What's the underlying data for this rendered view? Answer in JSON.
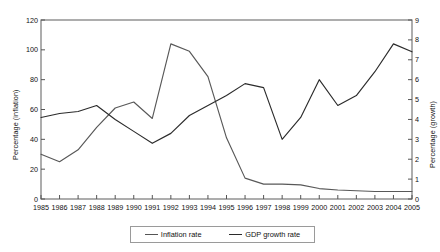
{
  "chart_data": {
    "type": "line",
    "title": "",
    "subtitle": "",
    "xlabel": "",
    "ylabel": "Percentage (inflation)",
    "ylabel_secondary": "Percentage (growth)",
    "x": [
      1985,
      1986,
      1987,
      1988,
      1989,
      1990,
      1991,
      1992,
      1993,
      1994,
      1995,
      1996,
      1997,
      1998,
      1999,
      2000,
      2001,
      2002,
      2003,
      2004,
      2005
    ],
    "xtick_labels": [
      "1985",
      "1986",
      "1987",
      "1988",
      "1989",
      "1990",
      "1991",
      "1992",
      "1993",
      "1994",
      "1995",
      "1996",
      "1997",
      "1998",
      "1999",
      "2000",
      "2001",
      "2002",
      "2003",
      "2004",
      "2005"
    ],
    "ylim": [
      0,
      120
    ],
    "ytick_labels": [
      "0",
      "20",
      "40",
      "60",
      "80",
      "100",
      "120"
    ],
    "ytick_values": [
      0,
      20,
      40,
      60,
      80,
      100,
      120
    ],
    "ylim_secondary": [
      0,
      9
    ],
    "ytick_labels_secondary": [
      "0",
      "1",
      "2",
      "3",
      "4",
      "5",
      "6",
      "7",
      "8",
      "9"
    ],
    "ytick_values_secondary": [
      0,
      1,
      2,
      3,
      4,
      5,
      6,
      7,
      8,
      9
    ],
    "grid": false,
    "legend_position": "bottom-center",
    "series": [
      {
        "name": "Inflation rate",
        "axis": "left",
        "color": "#585858",
        "values": [
          30,
          25,
          33,
          48,
          61,
          65,
          54,
          104,
          99,
          82,
          41,
          14,
          10,
          10,
          9.5,
          7,
          6,
          5.5,
          5,
          5,
          5
        ]
      },
      {
        "name": "GDP growth rate",
        "axis": "right",
        "color": "#2b2b2b",
        "values": [
          4.1,
          4.3,
          4.4,
          4.7,
          4.0,
          3.4,
          2.8,
          3.3,
          4.2,
          4.7,
          5.2,
          5.8,
          5.6,
          3.0,
          4.1,
          6.0,
          4.7,
          5.2,
          6.4,
          7.8,
          7.4
        ]
      }
    ]
  },
  "legend": {
    "items": [
      {
        "label": "Inflation rate"
      },
      {
        "label": "GDP growth rate"
      }
    ]
  }
}
